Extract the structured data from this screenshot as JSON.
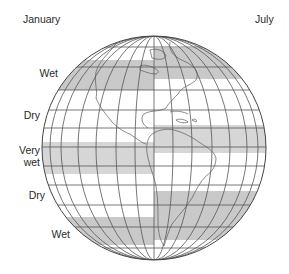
{
  "header": {
    "left_label": "January",
    "right_label": "July"
  },
  "side_labels": [
    {
      "id": "wet-north",
      "text": "Wet"
    },
    {
      "id": "dry-north",
      "text": "Dry"
    },
    {
      "id": "very-wet-line1",
      "text": "Very"
    },
    {
      "id": "very-wet-line2",
      "text": "wet"
    },
    {
      "id": "dry-south",
      "text": "Dry"
    },
    {
      "id": "wet-south",
      "text": "Wet"
    }
  ],
  "diagram": {
    "left_half_season": "January",
    "right_half_season": "July",
    "band_color": "#c9c9c9",
    "grid_color": "#4a4a4a",
    "coast_color": "#5a5a5a",
    "january_bands": [
      {
        "label": "Wet",
        "y_top": 60,
        "y_bottom": 90
      },
      {
        "label": "Very wet",
        "y_top": 142,
        "y_bottom": 174
      },
      {
        "label": "Wet",
        "y_top": 217,
        "y_bottom": 245
      }
    ],
    "july_bands": [
      {
        "label": "Wet",
        "y_top": 48,
        "y_bottom": 79
      },
      {
        "label": "Very wet",
        "y_top": 125,
        "y_bottom": 153
      },
      {
        "label": "Wet",
        "y_top": 191,
        "y_bottom": 240
      }
    ]
  }
}
